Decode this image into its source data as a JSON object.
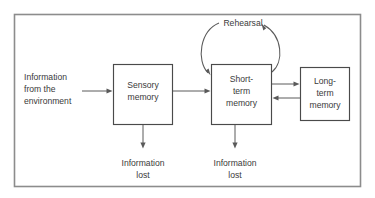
{
  "diagram": {
    "frame": {
      "border_color": "#8c8c8c",
      "background_color": "#ffffff"
    },
    "colors": {
      "box_stroke": "#4a4a4a",
      "connector": "#5a5a5a",
      "text": "#3a3a3a",
      "frame": "#8c8c8c",
      "background": "#ffffff"
    },
    "nodes": [
      {
        "id": "sensory-memory",
        "lines": [
          "Sensory",
          "memory"
        ],
        "line1": "Sensory",
        "line2": "memory"
      },
      {
        "id": "short-term-memory",
        "lines": [
          "Short-",
          "term",
          "memory"
        ],
        "line1": "Short-",
        "line2": "term",
        "line3": "memory"
      },
      {
        "id": "long-term-memory",
        "lines": [
          "Long-",
          "term",
          "memory"
        ],
        "line1": "Long-",
        "line2": "term",
        "line3": "memory"
      }
    ],
    "labels": {
      "input": {
        "id": "information-from-environment",
        "line1": "Information",
        "line2": "from the",
        "line3": "environment"
      },
      "rehearsal": {
        "id": "rehearsal",
        "text": "Rehearsal"
      },
      "loss_sensory": {
        "id": "information-lost-sensory",
        "line1": "Information",
        "line2": "lost"
      },
      "loss_short_term": {
        "id": "information-lost-short-term",
        "line1": "Information",
        "line2": "lost"
      }
    },
    "connections": [
      {
        "id": "environment-to-sensory",
        "from": "environment",
        "to": "sensory-memory",
        "direction": "right"
      },
      {
        "id": "sensory-to-short-term",
        "from": "sensory-memory",
        "to": "short-term-memory",
        "direction": "right"
      },
      {
        "id": "short-term-to-long-term",
        "from": "short-term-memory",
        "to": "long-term-memory",
        "direction": "right"
      },
      {
        "id": "long-term-to-short-term",
        "from": "long-term-memory",
        "to": "short-term-memory",
        "direction": "left"
      },
      {
        "id": "rehearsal-loop-out",
        "from": "short-term-memory",
        "to": "rehearsal",
        "direction": "up"
      },
      {
        "id": "rehearsal-loop-in",
        "from": "rehearsal",
        "to": "short-term-memory",
        "direction": "down"
      },
      {
        "id": "sensory-to-loss",
        "from": "sensory-memory",
        "to": "information-lost-sensory",
        "direction": "down"
      },
      {
        "id": "short-term-to-loss",
        "from": "short-term-memory",
        "to": "information-lost-short-term",
        "direction": "down"
      }
    ]
  }
}
